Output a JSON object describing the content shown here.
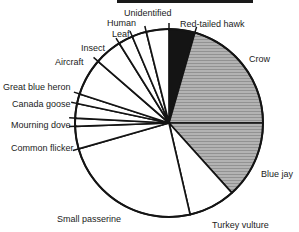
{
  "figure": {
    "kind": "scanned black-and-white pie chart",
    "visible_title": "",
    "background": "#ffffff"
  },
  "colors": {
    "ink": "#141414",
    "black_slice": "#141414",
    "halftone_base": "#b3b3b3",
    "halftone_line": "#929292",
    "paper": "#ffffff"
  },
  "chart_data": {
    "type": "pie",
    "title": "",
    "legend": "none (direct slice labels)",
    "start_angle": "12-oclock",
    "direction": "clockwise",
    "note": "No numeric values printed on chart; slice sizes estimated from wedge angles. Crow and Blue jay are halftone gray, Red-tailed hawk is solid black, all other slices are white.",
    "geometry": {
      "cx": 169,
      "cy": 123,
      "r": 94,
      "ext": 6
    },
    "slices": [
      {
        "label": "Red-tailed hawk",
        "degrees": 16,
        "percent": 4.4,
        "shade": "black",
        "label_x": 180,
        "label_y": 27
      },
      {
        "label": "Crow",
        "degrees": 74,
        "percent": 20.6,
        "shade": "gray-halftone",
        "label_x": 249,
        "label_y": 62
      },
      {
        "label": "Blue jay",
        "degrees": 48,
        "percent": 13.3,
        "shade": "gray-halftone",
        "label_x": 261,
        "label_y": 177
      },
      {
        "label": "Turkey vulture",
        "degrees": 29,
        "percent": 8.1,
        "shade": "white",
        "label_x": 212,
        "label_y": 228
      },
      {
        "label": "Small passerine",
        "degrees": 87,
        "percent": 24.2,
        "shade": "white",
        "label_x": 57,
        "label_y": 222
      },
      {
        "label": "Common flicker",
        "degrees": 14,
        "percent": 3.9,
        "shade": "white",
        "label_x": 11,
        "label_y": 151
      },
      {
        "label": "Mourning dove",
        "degrees": 5,
        "percent": 1.4,
        "shade": "white",
        "label_x": 11,
        "label_y": 128
      },
      {
        "label": "Canada goose",
        "degrees": 9,
        "percent": 2.5,
        "shade": "white",
        "label_x": 12,
        "label_y": 107
      },
      {
        "label": "Great blue heron",
        "degrees": 6,
        "percent": 1.7,
        "shade": "white",
        "label_x": 3,
        "label_y": 90
      },
      {
        "label": "Aircraft",
        "degrees": 23,
        "percent": 6.4,
        "shade": "white",
        "label_x": 55,
        "label_y": 65
      },
      {
        "label": "Insect",
        "degrees": 17,
        "percent": 4.7,
        "shade": "white",
        "label_x": 81,
        "label_y": 51
      },
      {
        "label": "Leaf",
        "degrees": 9,
        "percent": 2.5,
        "shade": "white",
        "label_x": 112,
        "label_y": 37
      },
      {
        "label": "Human",
        "degrees": 9,
        "percent": 2.5,
        "shade": "white",
        "label_x": 107,
        "label_y": 26
      },
      {
        "label": "Unidentified",
        "degrees": 14,
        "percent": 3.9,
        "shade": "white",
        "label_x": 124,
        "label_y": 16
      }
    ]
  }
}
